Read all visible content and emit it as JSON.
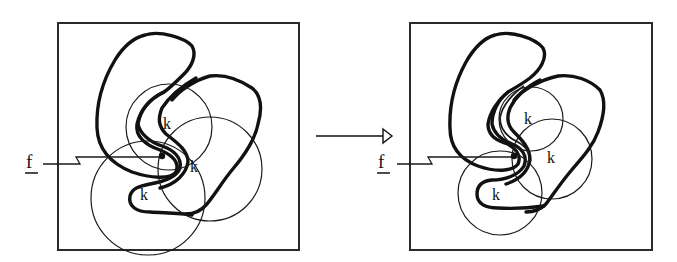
{
  "figure": {
    "left_panel": {
      "label_f": "f",
      "labels_k": [
        "k",
        "k",
        "k"
      ]
    },
    "transition_arrow": {
      "direction": "right"
    },
    "right_panel": {
      "label_f": "f",
      "labels_k": [
        "k",
        "k",
        "k"
      ]
    },
    "colors": {
      "stroke": "#111111",
      "background": "#ffffff"
    }
  }
}
